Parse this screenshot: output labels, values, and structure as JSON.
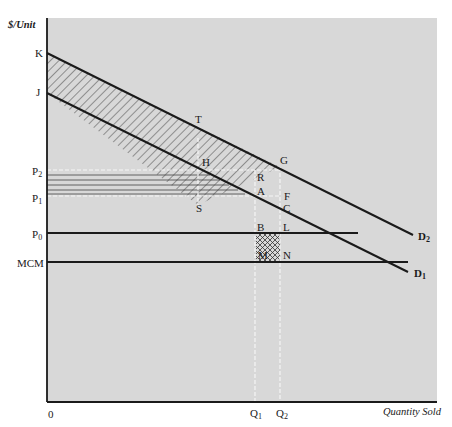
{
  "diagram": {
    "y_axis_label": "$/Unit",
    "x_axis_label": "Quantity Sold",
    "origin_label": "0",
    "colors": {
      "panel_background": "#d8d8d8",
      "line": "#1a1a1a",
      "dashed_guide": "#f5f5f5"
    },
    "price_labels": {
      "K": "K",
      "J": "J",
      "P2": {
        "base": "P",
        "sub": "2"
      },
      "P1": {
        "base": "P",
        "sub": "1"
      },
      "P0": {
        "base": "P",
        "sub": "0"
      },
      "MCM": "MCM"
    },
    "quantity_labels": {
      "Q1": {
        "base": "Q",
        "sub": "1"
      },
      "Q2": {
        "base": "Q",
        "sub": "2"
      }
    },
    "curve_labels": {
      "D2": {
        "base": "D",
        "sub": "2"
      },
      "D1": {
        "base": "D",
        "sub": "1"
      }
    },
    "point_labels": {
      "T": "T",
      "H": "H",
      "G": "G",
      "R": "R",
      "A": "A",
      "F": "F",
      "C": "C",
      "S": "S",
      "B": "B",
      "L": "L",
      "M": "M",
      "N": "N"
    },
    "regions": [
      {
        "name": "diagonal-hatched-region",
        "between": "D1 and D2 from axis to G",
        "pattern": "diagonal"
      },
      {
        "name": "horizontal-lined-region",
        "between": "P2 and P1, axis to D1",
        "pattern": "horizontal"
      },
      {
        "name": "cross-hatched-region",
        "between": "P0 and MCM, Q1 to Q2",
        "pattern": "crosshatch"
      }
    ]
  }
}
